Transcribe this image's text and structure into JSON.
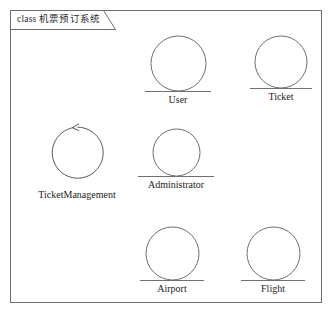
{
  "diagram": {
    "tab": {
      "keyword": "class",
      "title": "机票预订系统",
      "full_label": "class 机票预订系统",
      "icon": "package-tab-icon"
    },
    "frame_color": "#6e6e72",
    "stroke_color": "#6f6f74",
    "background": "#ffffff",
    "nodes": [
      {
        "id": "user",
        "label": "User",
        "shape": "circle",
        "diameter": 55,
        "underline": true,
        "arrow": false,
        "x": 145,
        "y": 35
      },
      {
        "id": "ticket",
        "label": "Ticket",
        "shape": "circle",
        "diameter": 52,
        "underline": true,
        "arrow": false,
        "x": 252,
        "y": 35
      },
      {
        "id": "ticketmanagement",
        "label": "TicketManagement",
        "shape": "circle",
        "diameter": 58,
        "underline": false,
        "arrow": true,
        "arrow_direction": "counterclockwise",
        "x": 38,
        "y": 124
      },
      {
        "id": "administrator",
        "label": "Administrator",
        "shape": "circle",
        "diameter": 47,
        "underline": true,
        "arrow": false,
        "x": 141,
        "y": 128
      },
      {
        "id": "airport",
        "label": "Airport",
        "shape": "circle",
        "diameter": 53,
        "underline": true,
        "arrow": false,
        "x": 141,
        "y": 226
      },
      {
        "id": "flight",
        "label": "Flight",
        "shape": "circle",
        "diameter": 53,
        "underline": true,
        "arrow": false,
        "x": 242,
        "y": 226
      }
    ]
  }
}
